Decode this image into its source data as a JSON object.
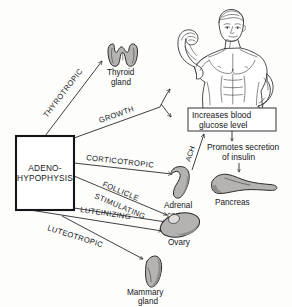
{
  "diagram": {
    "source_box": {
      "line1": "ADENO-",
      "line2": "HYPOPHYSIS"
    },
    "hormones": [
      {
        "id": "thyrotropic",
        "label": "THYROTROPIC",
        "target": "Thyroid gland"
      },
      {
        "id": "growth",
        "label": "GROWTH",
        "target": "Body growth / blood glucose"
      },
      {
        "id": "corticotropic",
        "label": "CORTICOTROPIC",
        "target": "Adrenal cortex"
      },
      {
        "id": "follicle-stimulating",
        "label_line1": "FOLLICLE",
        "label_line2": "STIMULATING",
        "target": "Ovary"
      },
      {
        "id": "luteinizing",
        "label": "LUTEINIZING",
        "target": "Ovary"
      },
      {
        "id": "luteotropic",
        "label": "LUTEOTROPIC",
        "target": "Mammary gland"
      }
    ],
    "organs": [
      {
        "id": "thyroid",
        "line1": "Thyroid",
        "line2": "gland"
      },
      {
        "id": "adrenal",
        "line1": "Adrenal",
        "line2": "cortex"
      },
      {
        "id": "pancreas",
        "line1": "Pancreas",
        "line2": ""
      },
      {
        "id": "ovary",
        "line1": "Ovary",
        "line2": ""
      },
      {
        "id": "mammary",
        "line1": "Mammary",
        "line2": "gland"
      }
    ],
    "callouts": {
      "glucose_box_line1": "Increases  blood",
      "glucose_box_line2": "glucose level",
      "insulin_line1": "Promotes secretion",
      "insulin_line2": "of  insulin",
      "ach_label": "ACH"
    },
    "figure": {
      "name": "flexing-man"
    },
    "colors": {
      "organ_fill": "#b4b3b1",
      "organ_shade": "#8e8d8b",
      "ink": "#15161a",
      "background": "#fdfdfc"
    }
  }
}
